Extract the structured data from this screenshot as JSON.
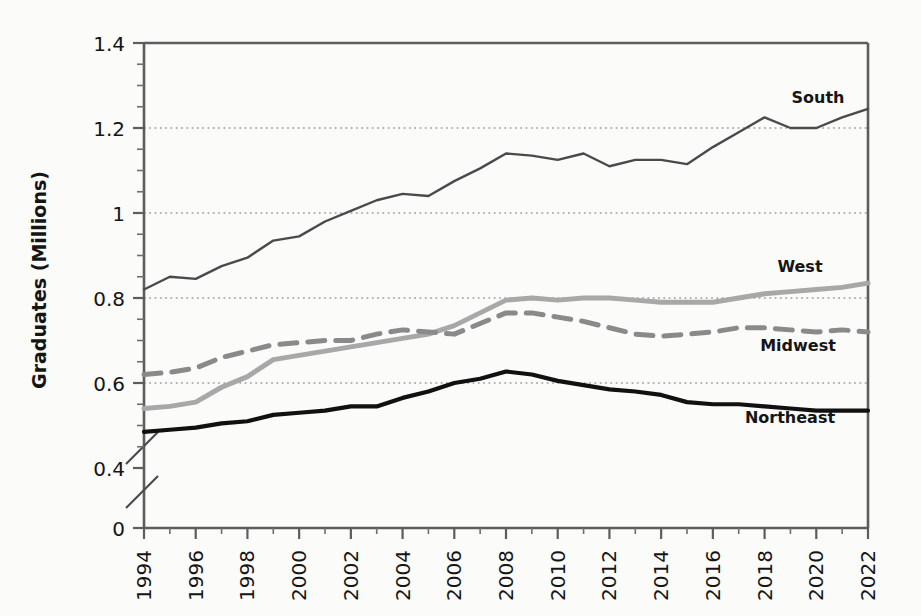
{
  "chart_data": {
    "type": "line",
    "title": "",
    "subtitle": "",
    "xlabel": "",
    "ylabel": "Graduates (Millions)",
    "xlim": [
      1994,
      2022
    ],
    "ylim": [
      0.4,
      1.4
    ],
    "y_axis_break": true,
    "y_axis_break_note": "axis broken between 0 and 0.4",
    "grid": "horizontal dotted gridlines at 0.6, 0.8, 1, 1.2",
    "legend_position": "inline labels at right of each series",
    "yticks": [
      "0",
      "0.4",
      "0.6",
      "0.8",
      "1",
      "1.2",
      "1.4"
    ],
    "ytick_values": [
      0,
      0.4,
      0.6,
      0.8,
      1.0,
      1.2,
      1.4
    ],
    "xticks": [
      "1994",
      "1996",
      "1998",
      "2000",
      "2002",
      "2004",
      "2006",
      "2008",
      "2010",
      "2012",
      "2014",
      "2016",
      "2018",
      "2020",
      "2022"
    ],
    "x": [
      1994,
      1995,
      1996,
      1997,
      1998,
      1999,
      2000,
      2001,
      2002,
      2003,
      2004,
      2005,
      2006,
      2007,
      2008,
      2009,
      2010,
      2011,
      2012,
      2013,
      2014,
      2015,
      2016,
      2017,
      2018,
      2019,
      2020,
      2021,
      2022
    ],
    "series": [
      {
        "name": "South",
        "style": "solid",
        "color": "#4a4a4a",
        "width": 2.4,
        "values": [
          0.82,
          0.85,
          0.845,
          0.875,
          0.895,
          0.935,
          0.945,
          0.98,
          1.005,
          1.03,
          1.045,
          1.04,
          1.075,
          1.105,
          1.14,
          1.135,
          1.125,
          1.14,
          1.11,
          1.125,
          1.125,
          1.115,
          1.155,
          1.19,
          1.225,
          1.2,
          1.2,
          1.225,
          1.245
        ]
      },
      {
        "name": "West",
        "style": "solid",
        "color": "#a8a8a8",
        "width": 5.0,
        "values": [
          0.54,
          0.545,
          0.555,
          0.59,
          0.615,
          0.655,
          0.665,
          0.675,
          0.685,
          0.695,
          0.705,
          0.715,
          0.735,
          0.765,
          0.795,
          0.8,
          0.795,
          0.8,
          0.8,
          0.795,
          0.79,
          0.79,
          0.79,
          0.8,
          0.81,
          0.815,
          0.82,
          0.825,
          0.835
        ]
      },
      {
        "name": "Midwest",
        "style": "dashed",
        "color": "#8a8a8a",
        "width": 5.0,
        "values": [
          0.62,
          0.625,
          0.635,
          0.66,
          0.675,
          0.69,
          0.695,
          0.7,
          0.7,
          0.715,
          0.725,
          0.72,
          0.715,
          0.74,
          0.765,
          0.765,
          0.755,
          0.745,
          0.73,
          0.715,
          0.71,
          0.715,
          0.72,
          0.73,
          0.73,
          0.725,
          0.72,
          0.725,
          0.72
        ]
      },
      {
        "name": "Northeast",
        "style": "solid",
        "color": "#111111",
        "width": 4.2,
        "values": [
          0.485,
          0.49,
          0.495,
          0.505,
          0.51,
          0.525,
          0.53,
          0.535,
          0.545,
          0.545,
          0.565,
          0.58,
          0.6,
          0.61,
          0.627,
          0.62,
          0.605,
          0.595,
          0.585,
          0.58,
          0.572,
          0.555,
          0.55,
          0.55,
          0.545,
          0.54,
          0.535,
          0.535,
          0.535
        ]
      }
    ],
    "annotations": [
      {
        "text": "South",
        "series": "South"
      },
      {
        "text": "West",
        "series": "West"
      },
      {
        "text": "Midwest",
        "series": "Midwest"
      },
      {
        "text": "Northeast",
        "series": "Northeast"
      }
    ]
  }
}
